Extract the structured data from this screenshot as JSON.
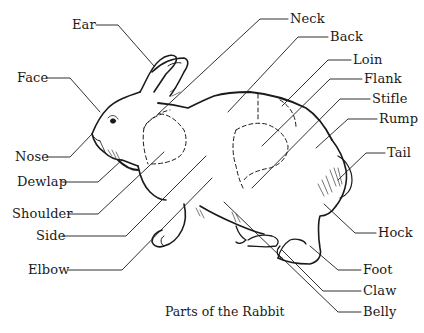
{
  "diagram": {
    "caption": "Parts of the Rabbit",
    "ink_color": "#1a1a1a",
    "background_color": "#ffffff"
  },
  "labels": {
    "ear": {
      "text": "Ear",
      "x": 72,
      "y": 17
    },
    "face": {
      "text": "Face",
      "x": 17,
      "y": 70
    },
    "nose": {
      "text": "Nose",
      "x": 15,
      "y": 149
    },
    "dewlap": {
      "text": "Dewlap",
      "x": 17,
      "y": 174
    },
    "shoulder": {
      "text": "Shoulder",
      "x": 12,
      "y": 206
    },
    "side": {
      "text": "Side",
      "x": 36,
      "y": 228
    },
    "elbow": {
      "text": "Elbow",
      "x": 28,
      "y": 262
    },
    "neck": {
      "text": "Neck",
      "x": 290,
      "y": 11
    },
    "back": {
      "text": "Back",
      "x": 330,
      "y": 29
    },
    "loin": {
      "text": "Loin",
      "x": 353,
      "y": 52
    },
    "flank": {
      "text": "Flank",
      "x": 364,
      "y": 71
    },
    "stifle": {
      "text": "Stifle",
      "x": 372,
      "y": 91
    },
    "rump": {
      "text": "Rump",
      "x": 379,
      "y": 111
    },
    "tail": {
      "text": "Tail",
      "x": 387,
      "y": 145
    },
    "hock": {
      "text": "Hock",
      "x": 378,
      "y": 225
    },
    "foot": {
      "text": "Foot",
      "x": 363,
      "y": 262
    },
    "claw": {
      "text": "Claw",
      "x": 363,
      "y": 283
    },
    "belly": {
      "text": "Belly",
      "x": 363,
      "y": 304
    }
  }
}
